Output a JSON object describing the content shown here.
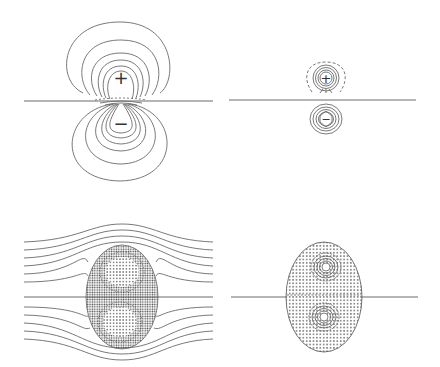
{
  "figure": {
    "panels": [
      {
        "id": "top-left",
        "label_plus": "+",
        "label_minus": "−",
        "kind": "dipole-field-lines-large"
      },
      {
        "id": "top-right",
        "label_plus": "+",
        "label_minus": "−",
        "kind": "dipole-field-lines-compact"
      },
      {
        "id": "bottom-left",
        "kind": "vortex-pair-with-streamlines"
      },
      {
        "id": "bottom-right",
        "kind": "vortex-pair-stippled-oval"
      }
    ],
    "colors": {
      "line": "#6a6a6a",
      "stipple": "#555555",
      "background": "#ffffff"
    }
  }
}
